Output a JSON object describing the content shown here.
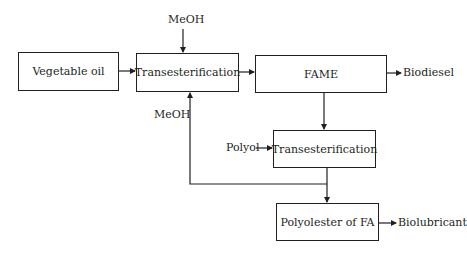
{
  "diagram": {
    "title": "",
    "nodes": [
      {
        "id": "vegetable_oil",
        "label": "Vegetable oil"
      },
      {
        "id": "trans1",
        "label": "Transesterification"
      },
      {
        "id": "fame",
        "label": "FAME"
      },
      {
        "id": "trans2",
        "label": "Transesterification"
      },
      {
        "id": "polyolester",
        "label": "Polyolester of FA"
      }
    ],
    "inputs": {
      "meoh_top": "MeOH",
      "meoh_recycle": "MeOH",
      "polyol": "Polyol"
    },
    "outputs": {
      "biodiesel": "Biodiesel",
      "biolubricant": "Biolubricant"
    },
    "edges": [
      {
        "from": "vegetable_oil",
        "to": "trans1"
      },
      {
        "from": "MeOH",
        "to": "trans1"
      },
      {
        "from": "trans1",
        "to": "fame"
      },
      {
        "from": "fame",
        "to": "Biodiesel"
      },
      {
        "from": "fame",
        "to": "trans2"
      },
      {
        "from": "Polyol",
        "to": "trans2"
      },
      {
        "from": "trans2",
        "to": "polyolester"
      },
      {
        "from": "trans2",
        "to": "trans1",
        "label": "MeOH"
      },
      {
        "from": "polyolester",
        "to": "Biolubricant"
      }
    ],
    "colors": {
      "line": "#231f20",
      "background": "#ffffff"
    }
  }
}
